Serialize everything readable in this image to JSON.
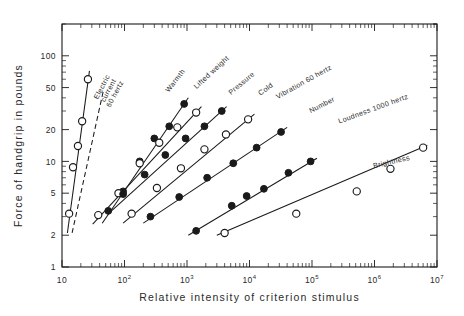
{
  "chart_data": {
    "type": "line",
    "title": "",
    "xlabel": "Relative intensity of criterion stimulus",
    "ylabel": "Force of handgrip in pounds",
    "xscale": "log",
    "yscale": "log",
    "xlim": [
      10,
      10000000
    ],
    "ylim": [
      1,
      200
    ],
    "grid": false,
    "legend_position": "inline-curve-labels",
    "xticks": [
      {
        "value": 10,
        "label": "10",
        "exponent": ""
      },
      {
        "value": 100,
        "label": "10",
        "exponent": "2"
      },
      {
        "value": 1000,
        "label": "10",
        "exponent": "3"
      },
      {
        "value": 10000,
        "label": "10",
        "exponent": "4"
      },
      {
        "value": 100000,
        "label": "10",
        "exponent": "5"
      },
      {
        "value": 1000000,
        "label": "10",
        "exponent": "6"
      },
      {
        "value": 10000000,
        "label": "10",
        "exponent": "7"
      }
    ],
    "yticks": [
      {
        "value": 1,
        "label": "1"
      },
      {
        "value": 2,
        "label": "2"
      },
      {
        "value": 5,
        "label": "5"
      },
      {
        "value": 10,
        "label": "10"
      },
      {
        "value": 20,
        "label": "20"
      },
      {
        "value": 50,
        "label": "50"
      },
      {
        "value": 100,
        "label": "100"
      }
    ],
    "series": [
      {
        "name": "Electric current 60 hertz",
        "label_lines": [
          "Electric",
          "current",
          "60 hertz"
        ],
        "marker": "open",
        "line": "solid",
        "exponent": 3.5,
        "x": [
          13,
          15,
          18,
          21,
          26
        ],
        "y": [
          3.2,
          8.8,
          14.0,
          24.0,
          60.0
        ]
      },
      {
        "name": "Warmth",
        "label_lines": [
          "Warmth"
        ],
        "marker": "none",
        "line": "dashed",
        "exponent": 1.6,
        "x": [],
        "y": []
      },
      {
        "name": "Lifted weight",
        "label_lines": [
          "Lifted weight"
        ],
        "marker": "filled",
        "line": "solid",
        "exponent": 1.1,
        "x": [
          55,
          95,
          175,
          300,
          520,
          900
        ],
        "y": [
          3.4,
          5.2,
          10.0,
          16.5,
          21.5,
          35.0
        ]
      },
      {
        "name": "Pressure",
        "label_lines": [
          "Pressure"
        ],
        "marker": "open",
        "line": "solid",
        "exponent": 1.0,
        "x": [
          38,
          80,
          175,
          360,
          700,
          1400
        ],
        "y": [
          3.1,
          5.0,
          9.6,
          15.0,
          21.0,
          29.0
        ]
      },
      {
        "name": "Cold",
        "label_lines": [
          "Cold"
        ],
        "marker": "filled",
        "line": "solid",
        "exponent": 0.95,
        "x": [
          95,
          210,
          450,
          950,
          1900,
          3600
        ],
        "y": [
          4.9,
          7.5,
          11.5,
          16.5,
          21.5,
          30.0
        ]
      },
      {
        "name": "Vibration 60 hertz",
        "label_lines": [
          "Vibration 60 hertz"
        ],
        "marker": "open",
        "line": "solid",
        "exponent": 0.8,
        "x": [
          130,
          330,
          800,
          1900,
          4200,
          9500
        ],
        "y": [
          3.2,
          5.6,
          8.6,
          13.0,
          18.0,
          25.0
        ]
      },
      {
        "name": "Number",
        "label_lines": [
          "Number"
        ],
        "marker": "filled",
        "line": "solid",
        "exponent": 0.7,
        "x": [
          260,
          750,
          2100,
          5500,
          13000,
          32000
        ],
        "y": [
          3.0,
          4.6,
          7.0,
          9.6,
          13.5,
          19.0
        ]
      },
      {
        "name": "Loudness 1000 hertz",
        "label_lines": [
          "Loudness 1000 hertz"
        ],
        "marker": "filled",
        "line": "solid",
        "exponent": 0.55,
        "x": [
          1400,
          5200,
          9000,
          17000,
          42000,
          95000
        ],
        "y": [
          2.2,
          3.8,
          4.7,
          5.5,
          7.8,
          10.0
        ]
      },
      {
        "name": "Brightness",
        "label_lines": [
          "Brightness"
        ],
        "marker": "open",
        "line": "solid",
        "exponent": 0.33,
        "x": [
          4000,
          56000,
          520000,
          1800000,
          6000000
        ],
        "y": [
          2.1,
          3.2,
          5.2,
          8.5,
          13.5
        ]
      }
    ]
  }
}
